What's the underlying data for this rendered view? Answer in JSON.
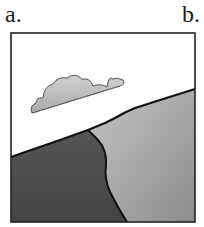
{
  "labels": {
    "a": "a.",
    "b": "b."
  },
  "figure": {
    "frame_color": "#222222",
    "sky_color": "#ffffff",
    "dark_region_color": "#4a4a4a",
    "light_region_color": "#a8a8a8",
    "cloud_fill": "#bdbdbd",
    "cloud_stroke": "#555555",
    "outline_color": "#111111"
  }
}
